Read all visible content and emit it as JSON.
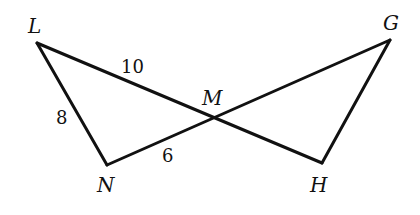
{
  "diagram": {
    "type": "geometry",
    "vertices": {
      "L": {
        "label": "L",
        "x": 37,
        "y": 43
      },
      "N": {
        "label": "N",
        "x": 107,
        "y": 165
      },
      "M": {
        "label": "M",
        "x": 211,
        "y": 120
      },
      "G": {
        "label": "G",
        "x": 390,
        "y": 40
      },
      "H": {
        "label": "H",
        "x": 322,
        "y": 163
      }
    },
    "segments": [
      {
        "from": "L",
        "to": "N"
      },
      {
        "from": "L",
        "to": "H"
      },
      {
        "from": "N",
        "to": "G"
      },
      {
        "from": "G",
        "to": "H"
      }
    ],
    "side_labels": {
      "LM": "10",
      "LN": "8",
      "NM": "6"
    },
    "vertex_labels": {
      "L": "L",
      "M": "M",
      "G": "G",
      "N": "N",
      "H": "H"
    },
    "colors": {
      "stroke": "#111111",
      "background": "#ffffff"
    }
  }
}
